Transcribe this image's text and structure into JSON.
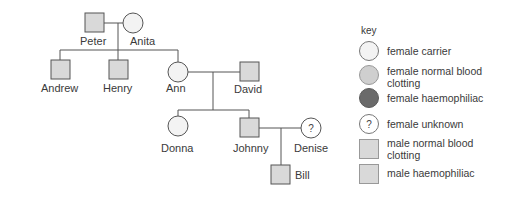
{
  "colors": {
    "line": "#555555",
    "male_fill": "#d9d9d9",
    "female_carrier_fill": "#f3f3f3",
    "female_normal_fill": "#cfcfcf",
    "female_haemophiliac_fill": "#6a6a6a",
    "female_unknown_fill": "#ffffff"
  },
  "pedigree": {
    "individuals": [
      {
        "name": "Peter",
        "sex": "male",
        "status": "male normal blood clotting"
      },
      {
        "name": "Anita",
        "sex": "female",
        "status": "female carrier"
      },
      {
        "name": "Andrew",
        "sex": "male",
        "status": "male normal blood clotting"
      },
      {
        "name": "Henry",
        "sex": "male",
        "status": "male normal blood clotting"
      },
      {
        "name": "Ann",
        "sex": "female",
        "status": "female carrier"
      },
      {
        "name": "David",
        "sex": "male",
        "status": "male normal blood clotting"
      },
      {
        "name": "Donna",
        "sex": "female",
        "status": "female carrier"
      },
      {
        "name": "Johnny",
        "sex": "male",
        "status": "male normal blood clotting"
      },
      {
        "name": "Denise",
        "sex": "female",
        "status": "female unknown",
        "symbol": "?"
      },
      {
        "name": "Bill",
        "sex": "male",
        "status": "male normal blood clotting"
      }
    ],
    "labels": {
      "peter": "Peter",
      "anita": "Anita",
      "andrew": "Andrew",
      "henry": "Henry",
      "ann": "Ann",
      "david": "David",
      "donna": "Donna",
      "johnny": "Johnny",
      "denise": "Denise",
      "bill": "Bill"
    },
    "unknown_symbol": "?"
  },
  "key": {
    "title": "key",
    "items": [
      {
        "label": "female carrier",
        "shape": "circle"
      },
      {
        "label": "female normal blood clotting",
        "shape": "circle"
      },
      {
        "label": "female haemophiliac",
        "shape": "circle"
      },
      {
        "label": "female unknown",
        "shape": "circle",
        "symbol": "?"
      },
      {
        "label": "male normal blood clotting",
        "shape": "square"
      },
      {
        "label": "male haemophiliac",
        "shape": "square"
      }
    ]
  }
}
